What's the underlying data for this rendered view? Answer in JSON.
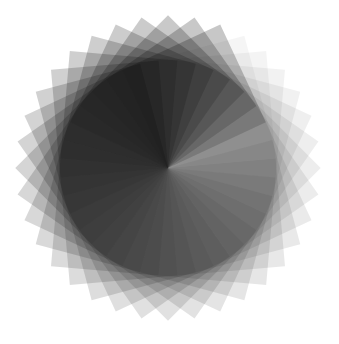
{
  "artwork": {
    "type": "rotational-rosette",
    "background": "#ffffff",
    "fill": "#000000",
    "center": [
      168,
      168
    ],
    "shape": "square",
    "shape_size": 108,
    "count": 36,
    "start_angle_deg": -60,
    "opacity_min": 0.04,
    "opacity_max": 0.22
  }
}
